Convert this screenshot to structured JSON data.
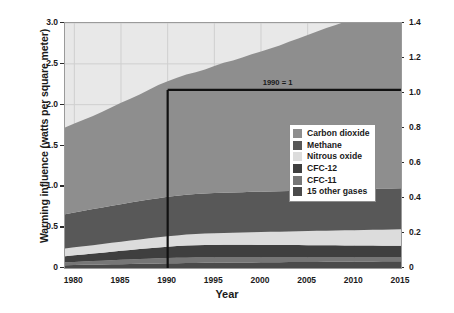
{
  "chart_data": {
    "type": "area",
    "title": "",
    "xlabel": "Year",
    "ylabel": "Warming influence (watts per square meter)",
    "ylabel_right": "Annual Greenhouse Gas Index",
    "xlim": [
      1979,
      2015
    ],
    "ylim": [
      0,
      3.0
    ],
    "ylim_right": [
      0,
      1.4
    ],
    "grid": true,
    "stacked": true,
    "legend_position": "inside-right",
    "xticks": [
      "1980",
      "1985",
      "1990",
      "1995",
      "2000",
      "2005",
      "2010",
      "2015"
    ],
    "xtick_values": [
      1980,
      1985,
      1990,
      1995,
      2000,
      2005,
      2010,
      2015
    ],
    "yticks_left": [
      "0",
      "0.5",
      "1.0",
      "1.5",
      "2.0",
      "2.5",
      "3.0"
    ],
    "ytick_values_left": [
      0,
      0.5,
      1.0,
      1.5,
      2.0,
      2.5,
      3.0
    ],
    "yticks_right": [
      "0",
      "0.2",
      "0.4",
      "0.6",
      "0.8",
      "1.0",
      "1.2",
      "1.4"
    ],
    "ytick_values_right": [
      0,
      0.2,
      0.4,
      0.6,
      0.8,
      1.0,
      1.2,
      1.4
    ],
    "x": [
      1979,
      1980,
      1981,
      1982,
      1983,
      1984,
      1985,
      1986,
      1987,
      1988,
      1989,
      1990,
      1991,
      1992,
      1993,
      1994,
      1995,
      1996,
      1997,
      1998,
      1999,
      2000,
      2001,
      2002,
      2003,
      2004,
      2005,
      2006,
      2007,
      2008,
      2009,
      2010,
      2011,
      2012,
      2013,
      2014,
      2015
    ],
    "series": [
      {
        "name": "15 other gases",
        "color": "#4a4a4a",
        "values": [
          0.035,
          0.037,
          0.039,
          0.041,
          0.043,
          0.045,
          0.047,
          0.049,
          0.051,
          0.053,
          0.055,
          0.057,
          0.059,
          0.061,
          0.062,
          0.063,
          0.064,
          0.065,
          0.066,
          0.067,
          0.068,
          0.069,
          0.07,
          0.071,
          0.072,
          0.073,
          0.074,
          0.075,
          0.076,
          0.077,
          0.078,
          0.079,
          0.08,
          0.081,
          0.082,
          0.083,
          0.084
        ]
      },
      {
        "name": "CFC-11",
        "color": "#767676",
        "values": [
          0.035,
          0.038,
          0.041,
          0.044,
          0.047,
          0.05,
          0.053,
          0.056,
          0.059,
          0.061,
          0.063,
          0.064,
          0.065,
          0.066,
          0.066,
          0.065,
          0.064,
          0.063,
          0.062,
          0.061,
          0.06,
          0.059,
          0.058,
          0.057,
          0.056,
          0.055,
          0.054,
          0.053,
          0.052,
          0.051,
          0.05,
          0.049,
          0.048,
          0.047,
          0.046,
          0.045,
          0.044
        ]
      },
      {
        "name": "CFC-12",
        "color": "#3f3f3f",
        "values": [
          0.074,
          0.08,
          0.086,
          0.092,
          0.098,
          0.104,
          0.11,
          0.116,
          0.122,
          0.128,
          0.134,
          0.14,
          0.145,
          0.149,
          0.152,
          0.154,
          0.155,
          0.156,
          0.156,
          0.156,
          0.156,
          0.155,
          0.155,
          0.154,
          0.154,
          0.153,
          0.152,
          0.152,
          0.151,
          0.15,
          0.149,
          0.148,
          0.147,
          0.146,
          0.145,
          0.144,
          0.143
        ]
      },
      {
        "name": "Nitrous oxide",
        "color": "#dcdcdc",
        "values": [
          0.095,
          0.098,
          0.1,
          0.103,
          0.106,
          0.109,
          0.112,
          0.115,
          0.118,
          0.121,
          0.124,
          0.127,
          0.13,
          0.133,
          0.136,
          0.139,
          0.142,
          0.145,
          0.148,
          0.151,
          0.154,
          0.157,
          0.16,
          0.163,
          0.166,
          0.169,
          0.172,
          0.175,
          0.178,
          0.181,
          0.184,
          0.187,
          0.19,
          0.193,
          0.196,
          0.199,
          0.202
        ]
      },
      {
        "name": "Methane",
        "color": "#585858",
        "values": [
          0.42,
          0.427,
          0.434,
          0.441,
          0.448,
          0.454,
          0.46,
          0.465,
          0.47,
          0.475,
          0.479,
          0.483,
          0.486,
          0.489,
          0.49,
          0.491,
          0.492,
          0.493,
          0.493,
          0.494,
          0.495,
          0.495,
          0.495,
          0.496,
          0.496,
          0.496,
          0.496,
          0.496,
          0.497,
          0.498,
          0.499,
          0.5,
          0.501,
          0.502,
          0.503,
          0.504,
          0.505
        ]
      },
      {
        "name": "Carbon dioxide",
        "color": "#8e8e8e",
        "values": [
          1.06,
          1.09,
          1.115,
          1.14,
          1.17,
          1.205,
          1.24,
          1.27,
          1.305,
          1.345,
          1.385,
          1.415,
          1.445,
          1.47,
          1.49,
          1.52,
          1.555,
          1.59,
          1.615,
          1.65,
          1.685,
          1.715,
          1.75,
          1.785,
          1.825,
          1.865,
          1.905,
          1.945,
          1.985,
          2.02,
          2.055,
          2.095,
          2.135,
          2.175,
          2.215,
          2.255,
          2.29
        ]
      }
    ],
    "annotations": [
      {
        "label": "1990 = 1",
        "x": 1990,
        "y": 2.18,
        "index_value": 1.0
      }
    ],
    "reference_lines": [
      {
        "orientation": "horizontal",
        "value": 2.18,
        "label": "1990 = 1"
      },
      {
        "orientation": "vertical",
        "value": 1990,
        "label": ""
      }
    ]
  },
  "legend": {
    "items": [
      {
        "label": "Carbon dioxide",
        "color": "#8e8e8e"
      },
      {
        "label": "Methane",
        "color": "#585858"
      },
      {
        "label": "Nitrous oxide",
        "color": "#dcdcdc"
      },
      {
        "label": "CFC-12",
        "color": "#3f3f3f"
      },
      {
        "label": "CFC-11",
        "color": "#767676"
      },
      {
        "label": "15 other gases",
        "color": "#4a4a4a"
      }
    ]
  },
  "style": {
    "plot_background": "#e8e8e8",
    "grid_color": "#cfcfcf",
    "frame_color": "#9a9a9a",
    "reference_line_color": "#111111",
    "text_color": "#1a1a1a"
  }
}
